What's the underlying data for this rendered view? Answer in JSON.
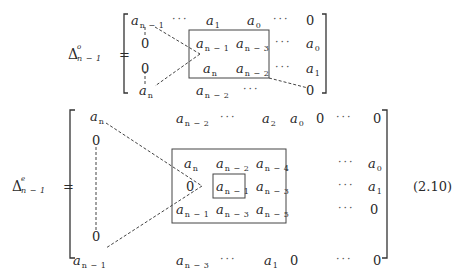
{
  "matrix1": {
    "lhs": {
      "symbol": "Δ",
      "superscript": "o",
      "subscript": "n − 1",
      "equals": "="
    },
    "rows": [
      [
        {
          "base": "a",
          "sub": "n − 1"
        },
        {
          "dots": "···"
        },
        {
          "base": "a",
          "sub": "1"
        },
        {
          "base": "a",
          "sub": "0"
        },
        {
          "dots": "···"
        },
        {
          "text": "0"
        }
      ],
      [
        {
          "text": "0"
        },
        {
          "base": "a",
          "sub": "n − 1"
        },
        {
          "base": "a",
          "sub": "n − 3"
        },
        {
          "dots": "···"
        },
        {
          "base": "a",
          "sub": "0"
        }
      ],
      [
        {
          "text": "0"
        },
        {
          "base": "a",
          "sub": "n"
        },
        {
          "base": "a",
          "sub": "n − 2"
        },
        {
          "dots": "···"
        },
        {
          "base": "a",
          "sub": "1"
        }
      ],
      [
        {
          "base": "a",
          "sub": "n"
        },
        {
          "base": "a",
          "sub": "n − 2"
        },
        {
          "dots": "···"
        },
        {
          "text": "0"
        }
      ]
    ]
  },
  "matrix2": {
    "lhs": {
      "symbol": "Δ",
      "superscript": "e",
      "subscript": "n − 1",
      "equals": "="
    },
    "rows": [
      [
        {
          "base": "a",
          "sub": "n"
        },
        {
          "base": "a",
          "sub": "n − 2"
        },
        {
          "dots": "···"
        },
        {
          "base": "a",
          "sub": "2"
        },
        {
          "base": "a",
          "sub": "0"
        },
        {
          "text": "0"
        },
        {
          "dots": "···"
        },
        {
          "text": "0"
        }
      ],
      [
        {
          "text": "0"
        }
      ],
      [
        {
          "base": "a",
          "sub": "n"
        },
        {
          "base": "a",
          "sub": "n − 2"
        },
        {
          "base": "a",
          "sub": "n − 4"
        },
        {
          "dots": "···"
        },
        {
          "base": "a",
          "sub": "0"
        }
      ],
      [
        {
          "text": "0"
        },
        {
          "base": "a",
          "sub": "n − 1"
        },
        {
          "base": "a",
          "sub": "n − 3"
        },
        {
          "dots": "···"
        },
        {
          "base": "a",
          "sub": "1"
        }
      ],
      [
        {
          "base": "a",
          "sub": "n − 1"
        },
        {
          "base": "a",
          "sub": "n − 3"
        },
        {
          "base": "a",
          "sub": "n − 5"
        },
        {
          "dots": "···"
        },
        {
          "text": "0"
        }
      ],
      [
        {
          "text": "0"
        }
      ],
      [
        {
          "base": "a",
          "sub": "n − 1"
        },
        {
          "base": "a",
          "sub": "n − 3"
        },
        {
          "dots": "···"
        },
        {
          "base": "a",
          "sub": "1"
        },
        {
          "text": "0"
        },
        {
          "dots": "···"
        },
        {
          "text": "0"
        }
      ]
    ]
  },
  "equation_number": "(2.10)"
}
